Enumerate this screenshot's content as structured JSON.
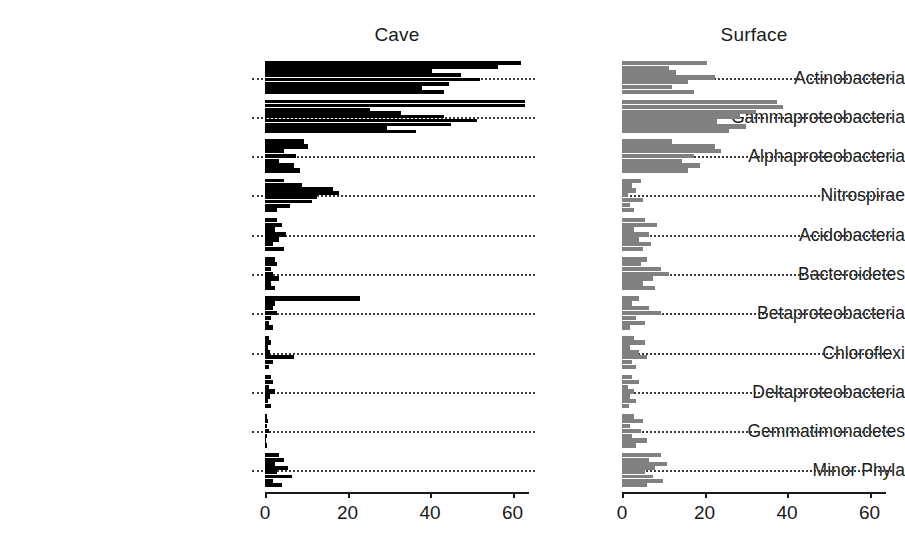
{
  "panels": [
    {
      "key": "cave",
      "label": "Cave",
      "color": "#000000"
    },
    {
      "key": "surface",
      "label": "Surface",
      "color": "#808080"
    }
  ],
  "axis": {
    "ticks": [
      0,
      20,
      40,
      60
    ],
    "tick_labels": [
      "0",
      "20",
      "40",
      "60"
    ],
    "xlim": [
      0,
      64
    ]
  },
  "chart_data": {
    "type": "bar",
    "orientation": "horizontal",
    "title": "",
    "subtitle": "",
    "xlabel": "",
    "ylabel": "",
    "xlim": [
      0,
      64
    ],
    "grid": "dotted-horizontal-per-category",
    "legend": "none",
    "panel_titles": [
      "Cave",
      "Surface"
    ],
    "categories": [
      "Actinobacteria",
      "Gammaproteobacteria",
      "Alphaproteobacteria",
      "Nitrospirae",
      "Acidobacteria",
      "Bacteroidetes",
      "Betaproteobacteria",
      "Chloroflexi",
      "Deltaproteobacteria",
      "Gemmatimonadetes",
      "Minor Phyla"
    ],
    "note": "Each category contains multiple thin sub-bars, one per sample; values are relative abundance percentages read off the shared 0-60 axis.",
    "series": [
      {
        "name": "Cave",
        "color": "#000000",
        "values_by_category": [
          [
            62.0,
            56.5,
            40.5,
            47.5,
            52.0,
            44.5,
            38.0,
            43.5
          ],
          [
            63.0,
            63.0,
            25.5,
            33.0,
            43.5,
            51.5,
            45.0,
            29.5,
            36.5
          ],
          [
            9.5,
            10.5,
            4.5,
            7.5,
            3.5,
            7.0,
            8.5
          ],
          [
            4.5,
            9.0,
            16.5,
            18.0,
            12.5,
            11.5,
            6.0,
            3.0
          ],
          [
            3.0,
            4.0,
            2.5,
            5.0,
            3.5,
            2.0,
            4.5
          ],
          [
            2.5,
            3.0,
            1.5,
            2.0,
            3.5,
            1.5,
            2.5
          ],
          [
            23.0,
            2.5,
            2.0,
            3.0,
            1.5,
            1.0,
            2.0
          ],
          [
            1.0,
            1.5,
            0.8,
            1.2,
            7.0,
            2.0,
            1.0
          ],
          [
            1.5,
            2.0,
            1.0,
            2.5,
            1.2,
            0.8,
            1.5
          ],
          [
            0.6,
            0.8,
            0.4,
            1.0,
            0.5,
            0.3,
            0.6
          ],
          [
            3.5,
            4.5,
            2.5,
            5.5,
            3.0,
            6.5,
            2.0,
            4.0
          ]
        ]
      },
      {
        "name": "Surface",
        "color": "#808080",
        "values_by_category": [
          [
            20.5,
            11.5,
            13.0,
            22.5,
            16.0,
            12.0,
            17.5
          ],
          [
            37.5,
            39.0,
            32.5,
            28.5,
            23.0,
            30.0,
            26.0
          ],
          [
            12.0,
            22.5,
            24.0,
            17.5,
            14.5,
            19.0,
            16.0
          ],
          [
            4.5,
            2.5,
            3.5,
            1.5,
            5.0,
            2.0,
            3.0
          ],
          [
            5.5,
            8.5,
            3.0,
            6.5,
            4.0,
            7.0,
            5.0
          ],
          [
            6.0,
            4.5,
            9.5,
            11.5,
            7.5,
            5.0,
            8.0
          ],
          [
            4.0,
            2.5,
            6.5,
            9.5,
            3.5,
            5.5,
            2.0
          ],
          [
            3.0,
            5.5,
            2.0,
            4.0,
            6.0,
            2.5,
            3.5
          ],
          [
            2.5,
            4.0,
            1.5,
            3.0,
            2.0,
            3.5,
            1.8
          ],
          [
            3.0,
            5.0,
            2.0,
            4.5,
            2.5,
            6.0,
            3.5
          ],
          [
            9.5,
            6.5,
            11.0,
            8.0,
            5.5,
            7.5,
            10.0,
            6.0
          ]
        ]
      }
    ]
  }
}
